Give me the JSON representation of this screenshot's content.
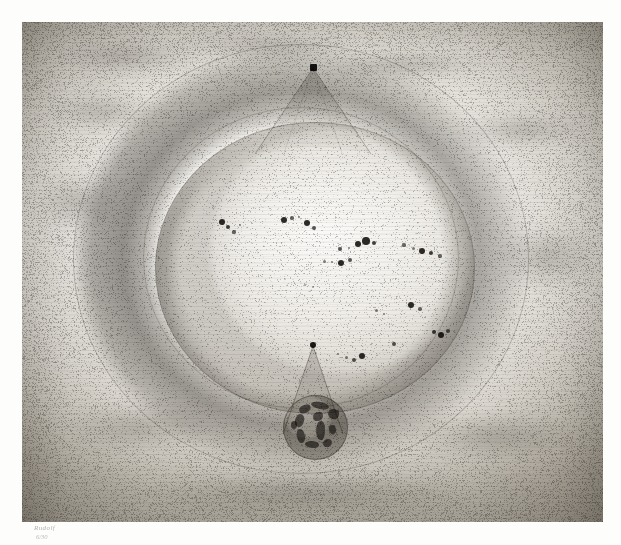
{
  "artwork": {
    "title": "Sun, Torus and Earth",
    "medium": "pencil / lithograph on paper",
    "background_color": "#ffffff",
    "paper_color": "#eceae5",
    "graphite_color": "#5c5852",
    "plate": {
      "x": 22,
      "y": 22,
      "width": 581,
      "height": 500
    }
  },
  "signature": {
    "line1": "Rudolf",
    "line2": "6/30"
  },
  "elements": {
    "torus": {
      "label": "outer torus ring",
      "center_x": 279,
      "center_y": 237,
      "outer_rx": 228,
      "outer_ry": 215,
      "inner_rx": 157,
      "inner_ry": 150
    },
    "sun_disc": {
      "label": "sun disc with sunspots",
      "center_x": 293,
      "center_y": 246,
      "rx": 160,
      "ry": 146
    },
    "upper_apex": {
      "label": "upper dark point",
      "x": 291,
      "y": 45
    },
    "lower_apex": {
      "label": "lower dark point",
      "x": 291,
      "y": 323
    },
    "earth_globe": {
      "label": "earth globe",
      "center_x": 293,
      "center_y": 428,
      "radius": 33
    }
  },
  "chart_data": {
    "type": "scatter",
    "xlabel": "",
    "ylabel": "",
    "sunspots": [
      {
        "x": 200,
        "y": 200,
        "r": 3.0,
        "op": 1.0
      },
      {
        "x": 206,
        "y": 205,
        "r": 2.2,
        "op": 0.9
      },
      {
        "x": 212,
        "y": 210,
        "r": 1.6,
        "op": 0.7
      },
      {
        "x": 218,
        "y": 203,
        "r": 1.4,
        "op": 0.6
      },
      {
        "x": 262,
        "y": 198,
        "r": 3.4,
        "op": 1.0
      },
      {
        "x": 270,
        "y": 196,
        "r": 1.6,
        "op": 0.7
      },
      {
        "x": 277,
        "y": 195,
        "r": 1.4,
        "op": 0.6
      },
      {
        "x": 285,
        "y": 201,
        "r": 3.0,
        "op": 1.0
      },
      {
        "x": 292,
        "y": 206,
        "r": 2.0,
        "op": 0.8
      },
      {
        "x": 318,
        "y": 227,
        "r": 2.0,
        "op": 0.8
      },
      {
        "x": 327,
        "y": 226,
        "r": 1.4,
        "op": 0.6
      },
      {
        "x": 336,
        "y": 222,
        "r": 3.0,
        "op": 1.0
      },
      {
        "x": 344,
        "y": 219,
        "r": 3.8,
        "op": 1.0
      },
      {
        "x": 352,
        "y": 221,
        "r": 2.2,
        "op": 0.9
      },
      {
        "x": 302,
        "y": 239,
        "r": 1.5,
        "op": 0.6
      },
      {
        "x": 310,
        "y": 240,
        "r": 1.4,
        "op": 0.6
      },
      {
        "x": 319,
        "y": 241,
        "r": 3.2,
        "op": 1.0
      },
      {
        "x": 328,
        "y": 238,
        "r": 2.0,
        "op": 0.8
      },
      {
        "x": 382,
        "y": 223,
        "r": 1.6,
        "op": 0.7
      },
      {
        "x": 391,
        "y": 226,
        "r": 1.5,
        "op": 0.6
      },
      {
        "x": 400,
        "y": 229,
        "r": 3.0,
        "op": 1.0
      },
      {
        "x": 409,
        "y": 231,
        "r": 2.4,
        "op": 0.9
      },
      {
        "x": 418,
        "y": 234,
        "r": 1.6,
        "op": 0.7
      },
      {
        "x": 389,
        "y": 283,
        "r": 3.0,
        "op": 1.0
      },
      {
        "x": 398,
        "y": 287,
        "r": 1.8,
        "op": 0.7
      },
      {
        "x": 412,
        "y": 310,
        "r": 2.4,
        "op": 0.9
      },
      {
        "x": 419,
        "y": 313,
        "r": 3.4,
        "op": 1.0
      },
      {
        "x": 426,
        "y": 309,
        "r": 1.8,
        "op": 0.7
      },
      {
        "x": 372,
        "y": 322,
        "r": 2.0,
        "op": 0.8
      },
      {
        "x": 340,
        "y": 334,
        "r": 3.4,
        "op": 1.0
      },
      {
        "x": 332,
        "y": 338,
        "r": 2.0,
        "op": 0.8
      },
      {
        "x": 324,
        "y": 335,
        "r": 1.5,
        "op": 0.6
      },
      {
        "x": 316,
        "y": 332,
        "r": 1.4,
        "op": 0.6
      },
      {
        "x": 354,
        "y": 288,
        "r": 1.5,
        "op": 0.6
      },
      {
        "x": 362,
        "y": 292,
        "r": 1.4,
        "op": 0.6
      },
      {
        "x": 283,
        "y": 263,
        "r": 1.2,
        "op": 0.45
      },
      {
        "x": 291,
        "y": 265,
        "r": 1.2,
        "op": 0.45
      }
    ],
    "continents": [
      {
        "x": 16,
        "y": 10,
        "w": 12,
        "h": 8,
        "rot": -18,
        "br": "50% 40% 60% 45%"
      },
      {
        "x": 28,
        "y": 7,
        "w": 18,
        "h": 7,
        "rot": 8,
        "br": "45% 55% 40% 60%"
      },
      {
        "x": 12,
        "y": 19,
        "w": 9,
        "h": 13,
        "rot": 12,
        "br": "55% 45% 50% 50%"
      },
      {
        "x": 30,
        "y": 17,
        "w": 10,
        "h": 9,
        "rot": -6,
        "br": "60% 40% 55% 45%"
      },
      {
        "x": 33,
        "y": 26,
        "w": 9,
        "h": 19,
        "rot": 6,
        "br": "45% 55% 35% 65%"
      },
      {
        "x": 14,
        "y": 34,
        "w": 8,
        "h": 14,
        "rot": -14,
        "br": "50% 50% 60% 40%"
      },
      {
        "x": 45,
        "y": 14,
        "w": 11,
        "h": 10,
        "rot": 20,
        "br": "55% 45% 45% 55%"
      },
      {
        "x": 46,
        "y": 30,
        "w": 7,
        "h": 9,
        "rot": -10,
        "br": "50% 50% 50% 50%"
      },
      {
        "x": 22,
        "y": 46,
        "w": 14,
        "h": 7,
        "rot": 4,
        "br": "50% 50% 45% 55%"
      },
      {
        "x": 40,
        "y": 44,
        "w": 9,
        "h": 8,
        "rot": -8,
        "br": "55% 45% 55% 45%"
      },
      {
        "x": 8,
        "y": 26,
        "w": 6,
        "h": 8,
        "rot": 0,
        "br": "50% 50% 50% 50%"
      }
    ],
    "clouds": [
      {
        "x": 30,
        "y": 18,
        "w": 150,
        "h": 34
      },
      {
        "x": 150,
        "y": 10,
        "w": 190,
        "h": 28
      },
      {
        "x": 300,
        "y": 30,
        "w": 170,
        "h": 26
      },
      {
        "x": 20,
        "y": 70,
        "w": 120,
        "h": 40
      },
      {
        "x": 430,
        "y": 90,
        "w": 140,
        "h": 36
      },
      {
        "x": 10,
        "y": 150,
        "w": 90,
        "h": 60
      },
      {
        "x": 470,
        "y": 200,
        "w": 110,
        "h": 70
      },
      {
        "x": 40,
        "y": 380,
        "w": 160,
        "h": 50
      },
      {
        "x": 380,
        "y": 390,
        "w": 180,
        "h": 48
      },
      {
        "x": 120,
        "y": 450,
        "w": 330,
        "h": 44
      }
    ]
  }
}
